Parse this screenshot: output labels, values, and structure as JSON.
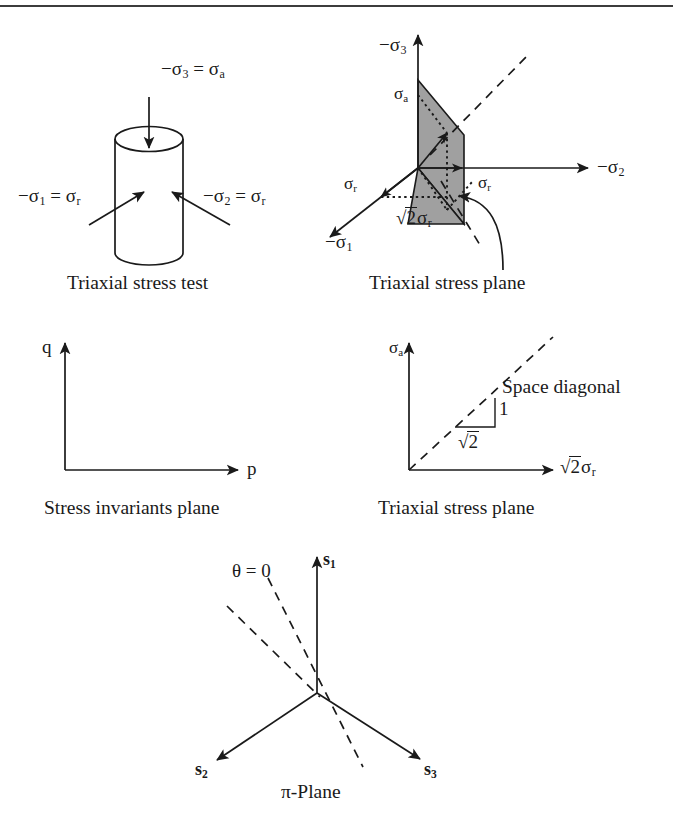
{
  "figure": {
    "background": "#ffffff",
    "ink_color": "#1a1a1a",
    "plane_fill": "#a0a0a0"
  },
  "panels": [
    {
      "id": "triaxial-stress-test",
      "caption": "Triaxial stress test",
      "labels": {
        "axial": "−σ",
        "axial_sub": "3",
        "axial_eq": " = σ",
        "axial_eq_sub": "a",
        "radial1": "−σ",
        "radial1_sub": "1",
        "radial1_eq": " = σ",
        "radial1_eq_sub": "r",
        "radial2": "−σ",
        "radial2_sub": "2",
        "radial2_eq": " = σ",
        "radial2_eq_sub": "r"
      }
    },
    {
      "id": "triaxial-stress-plane-3d",
      "caption": "Triaxial stress plane",
      "labels": {
        "axis_s3": "−σ",
        "axis_s3_sub": "3",
        "axis_s2": "−σ",
        "axis_s2_sub": "2",
        "axis_s1": "−σ",
        "axis_s1_sub": "1",
        "sigma_a": "σ",
        "sigma_a_sub": "a",
        "sigma_r_left": "σ",
        "sigma_r_left_sub": "r",
        "sigma_r_right": "σ",
        "sigma_r_right_sub": "r",
        "sqrt2_sigma_r_radicand": "2",
        "sqrt2_sigma_r_tail": "σ",
        "sqrt2_sigma_r_sub": "r"
      }
    },
    {
      "id": "stress-invariants-plane",
      "caption": "Stress invariants plane",
      "labels": {
        "y_axis": "q",
        "x_axis": "p"
      }
    },
    {
      "id": "triaxial-stress-plane-2d",
      "caption": "Triaxial stress plane",
      "labels": {
        "y_axis": "σ",
        "y_axis_sub": "a",
        "x_axis_radicand": "2",
        "x_axis_tail": "σ",
        "x_axis_sub": "r",
        "diagonal": "Space diagonal",
        "rise": "1",
        "run_radicand": "2"
      }
    },
    {
      "id": "pi-plane",
      "caption": "π-Plane",
      "labels": {
        "axis_s1": "s",
        "axis_s1_sub": "1",
        "axis_s2": "s",
        "axis_s2_sub": "2",
        "axis_s3": "s",
        "axis_s3_sub": "3",
        "theta": "θ = 0"
      }
    }
  ]
}
